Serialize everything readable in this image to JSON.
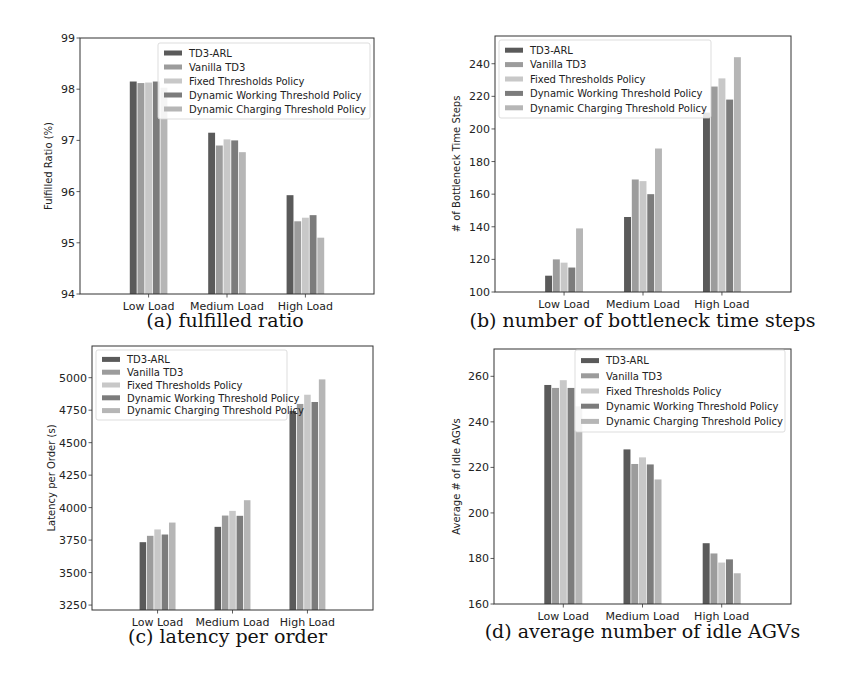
{
  "figure": {
    "series_names": [
      "TD3-ARL",
      "Vanilla TD3",
      "Fixed Thresholds Policy",
      "Dynamic Working Threshold Policy",
      "Dynamic Charging Threshold Policy"
    ],
    "series_colors": [
      "#5a5a5a",
      "#9c9c9c",
      "#c8c8c8",
      "#7c7c7c",
      "#b6b6b6"
    ],
    "categories": [
      "Low Load",
      "Medium Load",
      "High Load"
    ]
  },
  "chart_data": [
    {
      "id": "a",
      "type": "bar",
      "caption": "(a) fulfilled ratio",
      "title": "",
      "xlabel": "",
      "ylabel": "Fulfilled Ratio (%)",
      "categories": [
        "Low Load",
        "Medium Load",
        "High Load"
      ],
      "ylim": [
        94,
        99
      ],
      "yticks": [
        94,
        95,
        96,
        97,
        98,
        99
      ],
      "grid": false,
      "legend_position": "upper right",
      "series": [
        {
          "name": "TD3-ARL",
          "values": [
            98.15,
            97.15,
            95.93
          ]
        },
        {
          "name": "Vanilla TD3",
          "values": [
            98.12,
            96.9,
            95.42
          ]
        },
        {
          "name": "Fixed Thresholds Policy",
          "values": [
            98.13,
            97.02,
            95.49
          ]
        },
        {
          "name": "Dynamic Working Threshold Policy",
          "values": [
            98.15,
            97.0,
            95.54
          ]
        },
        {
          "name": "Dynamic Charging Threshold Policy",
          "values": [
            98.03,
            96.77,
            95.1
          ]
        }
      ]
    },
    {
      "id": "b",
      "type": "bar",
      "caption": "(b) number of bottleneck time steps",
      "title": "",
      "xlabel": "",
      "ylabel": "# of Bottleneck Time Steps",
      "categories": [
        "Low Load",
        "Medium Load",
        "High Load"
      ],
      "ylim": [
        100,
        257
      ],
      "yticks": [
        100,
        120,
        140,
        160,
        180,
        200,
        220,
        240
      ],
      "grid": false,
      "legend_position": "upper left",
      "series": [
        {
          "name": "TD3-ARL",
          "values": [
            110,
            146,
            210
          ]
        },
        {
          "name": "Vanilla TD3",
          "values": [
            120,
            169,
            226
          ]
        },
        {
          "name": "Fixed Thresholds Policy",
          "values": [
            118,
            168,
            231
          ]
        },
        {
          "name": "Dynamic Working Threshold Policy",
          "values": [
            115,
            160,
            218
          ]
        },
        {
          "name": "Dynamic Charging Threshold Policy",
          "values": [
            139,
            188,
            244
          ]
        }
      ]
    },
    {
      "id": "c",
      "type": "bar",
      "caption": "(c) latency per order",
      "title": "",
      "xlabel": "",
      "ylabel": "Latency per Order (s)",
      "categories": [
        "Low Load",
        "Medium Load",
        "High Load"
      ],
      "ylim": [
        3212,
        5244
      ],
      "yticks": [
        3250,
        3500,
        3750,
        4000,
        4250,
        4500,
        4750,
        5000
      ],
      "grid": false,
      "legend_position": "upper left",
      "series": [
        {
          "name": "TD3-ARL",
          "values": [
            3734,
            3852,
            4744
          ]
        },
        {
          "name": "Vanilla TD3",
          "values": [
            3783,
            3939,
            4798
          ]
        },
        {
          "name": "Fixed Thresholds Policy",
          "values": [
            3832,
            3975,
            4869
          ]
        },
        {
          "name": "Dynamic Working Threshold Policy",
          "values": [
            3793,
            3937,
            4813
          ]
        },
        {
          "name": "Dynamic Charging Threshold Policy",
          "values": [
            3885,
            4057,
            4987
          ]
        }
      ]
    },
    {
      "id": "d",
      "type": "bar",
      "caption": "(d) average number of idle AGVs",
      "title": "",
      "xlabel": "",
      "ylabel": "Average # of Idle AGVs",
      "categories": [
        "Low Load",
        "Medium Load",
        "High Load"
      ],
      "ylim": [
        160,
        272
      ],
      "yticks": [
        160,
        180,
        200,
        220,
        240,
        260
      ],
      "grid": false,
      "legend_position": "upper right",
      "series": [
        {
          "name": "TD3-ARL",
          "values": [
            256.2,
            227.9,
            186.7
          ]
        },
        {
          "name": "Vanilla TD3",
          "values": [
            254.9,
            221.5,
            182.2
          ]
        },
        {
          "name": "Fixed Thresholds Policy",
          "values": [
            258.3,
            224.4,
            178.2
          ]
        },
        {
          "name": "Dynamic Working Threshold Policy",
          "values": [
            254.9,
            221.3,
            179.6
          ]
        },
        {
          "name": "Dynamic Charging Threshold Policy",
          "values": [
            246.8,
            214.7,
            173.5
          ]
        }
      ]
    }
  ]
}
